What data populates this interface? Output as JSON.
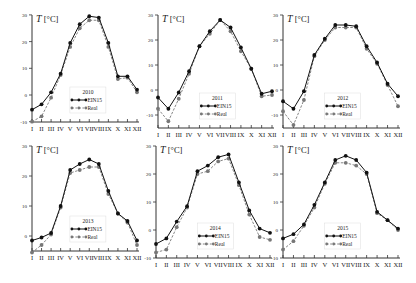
{
  "figure": {
    "ylabel": "T [°C]",
    "months": [
      "I",
      "II",
      "III",
      "IV",
      "V",
      "VI",
      "VII",
      "VIII",
      "IX",
      "X",
      "XI",
      "XII"
    ],
    "legend": {
      "series1": "EIN15",
      "series2": "Real"
    },
    "colors": {
      "ein15": "#111111",
      "real": "#777777",
      "axis": "#333333"
    }
  },
  "chart_data": [
    {
      "type": "line",
      "title": "2010",
      "xlabel": "",
      "ylabel": "T [°C]",
      "categories": [
        "I",
        "II",
        "III",
        "IV",
        "V",
        "VI",
        "VII",
        "VIII",
        "IX",
        "X",
        "XI",
        "XII"
      ],
      "ylim": [
        -10,
        30
      ],
      "yticks": [
        -10,
        0,
        10,
        20,
        30
      ],
      "grid": false,
      "legend_position": "lower center",
      "series": [
        {
          "name": "EIN15",
          "values": [
            -5.5,
            -3.5,
            1,
            8,
            19.5,
            26.5,
            29.5,
            29,
            19.5,
            7,
            7,
            2
          ]
        },
        {
          "name": "Real",
          "values": [
            -10,
            -8,
            -1,
            7.5,
            18,
            25,
            28,
            28,
            18,
            6,
            6.5,
            1
          ]
        }
      ]
    },
    {
      "type": "line",
      "title": "2011",
      "xlabel": "",
      "ylabel": "T [°C]",
      "categories": [
        "I",
        "II",
        "III",
        "IV",
        "V",
        "VI",
        "VII",
        "VIII",
        "IX",
        "X",
        "XI",
        "XII"
      ],
      "ylim": [
        -15,
        30
      ],
      "yticks": [
        -10,
        0,
        10,
        20,
        30
      ],
      "grid": false,
      "legend_position": "lower center",
      "series": [
        {
          "name": "EIN15",
          "values": [
            -3,
            -7.5,
            -1,
            7.5,
            17.5,
            23.5,
            28,
            25,
            17,
            8.5,
            -1.5,
            -0.5
          ]
        },
        {
          "name": "Real",
          "values": [
            -7.5,
            -12.5,
            -3.5,
            6.5,
            17.5,
            22.5,
            28,
            23.5,
            15.5,
            8.5,
            -2.5,
            -2
          ]
        }
      ]
    },
    {
      "type": "line",
      "title": "2012",
      "xlabel": "",
      "ylabel": "T [°C]",
      "categories": [
        "I",
        "II",
        "III",
        "IV",
        "V",
        "VI",
        "VII",
        "VIII",
        "IX",
        "X",
        "XI",
        "XII"
      ],
      "ylim": [
        -15,
        30
      ],
      "yticks": [
        -10,
        0,
        10,
        20,
        30
      ],
      "grid": false,
      "legend_position": "lower center",
      "series": [
        {
          "name": "EIN15",
          "values": [
            -4.5,
            -7.5,
            -0.5,
            14,
            20.5,
            26,
            26,
            25.5,
            17.5,
            11,
            2.5,
            -2.5
          ]
        },
        {
          "name": "Real",
          "values": [
            -8.5,
            -14,
            -4,
            13.5,
            20,
            25,
            25,
            25,
            16.5,
            10.5,
            2,
            -6.5
          ]
        }
      ]
    },
    {
      "type": "line",
      "title": "2013",
      "xlabel": "",
      "ylabel": "T [°C]",
      "categories": [
        "I",
        "II",
        "III",
        "IV",
        "V",
        "VI",
        "VII",
        "VIII",
        "IX",
        "X",
        "XI",
        "XII"
      ],
      "ylim": [
        -7,
        30
      ],
      "yticks": [
        0,
        10,
        20,
        30
      ],
      "grid": false,
      "legend_position": "lower center",
      "series": [
        {
          "name": "EIN15",
          "values": [
            -1.5,
            -0.5,
            1,
            10,
            22,
            24,
            25.5,
            24,
            15,
            7.5,
            5,
            -1.5
          ]
        },
        {
          "name": "Real",
          "values": [
            -5.5,
            -3,
            0.5,
            9.5,
            21,
            22,
            23,
            23,
            14,
            7.5,
            4.5,
            -3
          ]
        }
      ]
    },
    {
      "type": "line",
      "title": "2014",
      "xlabel": "",
      "ylabel": "T [°C]",
      "categories": [
        "I",
        "II",
        "III",
        "IV",
        "V",
        "VI",
        "VII",
        "VIII",
        "IX",
        "X",
        "XI",
        "XII"
      ],
      "ylim": [
        -10,
        30
      ],
      "yticks": [
        -10,
        0,
        10,
        20,
        30
      ],
      "grid": false,
      "legend_position": "lower center",
      "series": [
        {
          "name": "EIN15",
          "values": [
            -5,
            -3,
            3,
            8.5,
            21,
            23,
            26,
            27,
            17,
            7,
            0.5,
            -1
          ]
        },
        {
          "name": "Real",
          "values": [
            -8,
            -7,
            1,
            8,
            20,
            21,
            24.5,
            25.5,
            16,
            5.5,
            -2.5,
            -3.5
          ]
        }
      ]
    },
    {
      "type": "line",
      "title": "2015",
      "xlabel": "",
      "ylabel": "T [°C]",
      "categories": [
        "I",
        "II",
        "III",
        "IV",
        "V",
        "VI",
        "VII",
        "VIII",
        "IX",
        "X",
        "XI",
        "XII"
      ],
      "ylim": [
        -10,
        30
      ],
      "yticks": [
        -10,
        0,
        10,
        20,
        30
      ],
      "grid": false,
      "legend_position": "lower center",
      "series": [
        {
          "name": "EIN15",
          "values": [
            -3,
            -1.5,
            2,
            9,
            17,
            25,
            26.5,
            25,
            20.5,
            6.5,
            3.5,
            0.5
          ]
        },
        {
          "name": "Real",
          "values": [
            -7,
            -4,
            1.5,
            8,
            16.5,
            24,
            24,
            23,
            20,
            6,
            3.5,
            0
          ]
        }
      ]
    }
  ]
}
